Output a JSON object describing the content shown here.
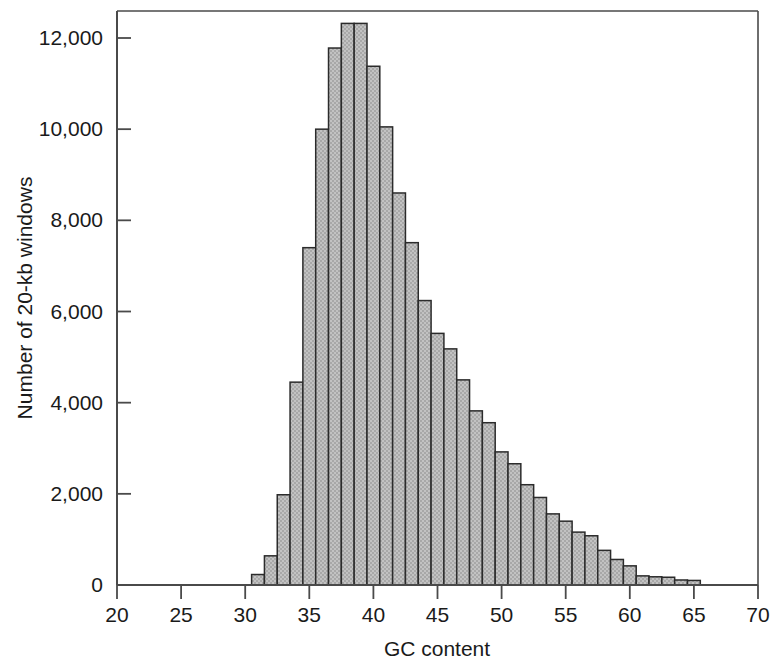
{
  "chart_data": {
    "type": "bar",
    "title": "",
    "subtitle": "",
    "xlabel": "GC content",
    "ylabel": "Number of 20-kb windows",
    "xlim": [
      20,
      70
    ],
    "ylim": [
      0,
      12600
    ],
    "grid": false,
    "legend": null,
    "bin_width": 1,
    "xticks": [
      20,
      25,
      30,
      35,
      40,
      45,
      50,
      55,
      60,
      65,
      70
    ],
    "xtick_labels": [
      "20",
      "25",
      "30",
      "35",
      "40",
      "45",
      "50",
      "55",
      "60",
      "65",
      "70"
    ],
    "yticks": [
      0,
      2000,
      4000,
      6000,
      8000,
      10000,
      12000
    ],
    "ytick_labels": [
      "0",
      "2,000",
      "4,000",
      "6,000",
      "8,000",
      "10,000",
      "12,000"
    ],
    "bar_fill_color": "#b9b9b9",
    "bar_edge_color": "#2b2b2b",
    "axis_color": "#4a4a4a",
    "categories": [
      "30.5",
      "31.5",
      "32.5",
      "33.5",
      "34.5",
      "35.5",
      "36.5",
      "37.5",
      "38.5",
      "39.5",
      "40.5",
      "41.5",
      "42.5",
      "43.5",
      "44.5",
      "45.5",
      "46.5",
      "47.5",
      "48.5",
      "49.5",
      "50.5",
      "51.5",
      "52.5",
      "53.5",
      "54.5",
      "55.5",
      "56.5",
      "57.5",
      "58.5",
      "59.5",
      "60.5",
      "61.5",
      "62.5",
      "63.5",
      "64.5"
    ],
    "bins": [
      {
        "x0": 30.5,
        "x1": 31.5,
        "value": 230
      },
      {
        "x0": 31.5,
        "x1": 32.5,
        "value": 640
      },
      {
        "x0": 32.5,
        "x1": 33.5,
        "value": 1980
      },
      {
        "x0": 33.5,
        "x1": 34.5,
        "value": 4450
      },
      {
        "x0": 34.5,
        "x1": 35.5,
        "value": 7400
      },
      {
        "x0": 35.5,
        "x1": 36.5,
        "value": 10000
      },
      {
        "x0": 36.5,
        "x1": 37.5,
        "value": 11780
      },
      {
        "x0": 37.5,
        "x1": 38.5,
        "value": 12320
      },
      {
        "x0": 38.5,
        "x1": 39.5,
        "value": 12320
      },
      {
        "x0": 39.5,
        "x1": 40.5,
        "value": 11380
      },
      {
        "x0": 40.5,
        "x1": 41.5,
        "value": 10050
      },
      {
        "x0": 41.5,
        "x1": 42.5,
        "value": 8600
      },
      {
        "x0": 42.5,
        "x1": 43.5,
        "value": 7510
      },
      {
        "x0": 43.5,
        "x1": 44.5,
        "value": 6240
      },
      {
        "x0": 44.5,
        "x1": 45.5,
        "value": 5520
      },
      {
        "x0": 45.5,
        "x1": 46.5,
        "value": 5180
      },
      {
        "x0": 46.5,
        "x1": 47.5,
        "value": 4500
      },
      {
        "x0": 47.5,
        "x1": 48.5,
        "value": 3820
      },
      {
        "x0": 48.5,
        "x1": 49.5,
        "value": 3560
      },
      {
        "x0": 49.5,
        "x1": 50.5,
        "value": 2920
      },
      {
        "x0": 50.5,
        "x1": 51.5,
        "value": 2660
      },
      {
        "x0": 51.5,
        "x1": 52.5,
        "value": 2200
      },
      {
        "x0": 52.5,
        "x1": 53.5,
        "value": 1920
      },
      {
        "x0": 53.5,
        "x1": 54.5,
        "value": 1560
      },
      {
        "x0": 54.5,
        "x1": 55.5,
        "value": 1400
      },
      {
        "x0": 55.5,
        "x1": 56.5,
        "value": 1160
      },
      {
        "x0": 56.5,
        "x1": 57.5,
        "value": 1080
      },
      {
        "x0": 57.5,
        "x1": 58.5,
        "value": 760
      },
      {
        "x0": 58.5,
        "x1": 59.5,
        "value": 560
      },
      {
        "x0": 59.5,
        "x1": 60.5,
        "value": 420
      },
      {
        "x0": 60.5,
        "x1": 61.5,
        "value": 200
      },
      {
        "x0": 61.5,
        "x1": 62.5,
        "value": 180
      },
      {
        "x0": 62.5,
        "x1": 63.5,
        "value": 170
      },
      {
        "x0": 63.5,
        "x1": 64.5,
        "value": 110
      },
      {
        "x0": 64.5,
        "x1": 65.5,
        "value": 100
      }
    ],
    "values": [
      230,
      640,
      1980,
      4450,
      7400,
      10000,
      11780,
      12320,
      12320,
      11380,
      10050,
      8600,
      7510,
      6240,
      5520,
      5180,
      4500,
      3820,
      3560,
      2920,
      2660,
      2200,
      1920,
      1560,
      1400,
      1160,
      1080,
      760,
      560,
      420,
      200,
      180,
      170,
      110,
      100
    ]
  }
}
